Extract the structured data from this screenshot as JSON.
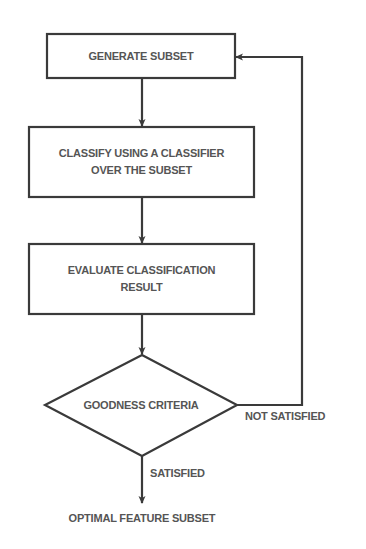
{
  "diagram": {
    "type": "flowchart",
    "colors": {
      "line": "#3a3a3a",
      "text": "#555555",
      "background": "#ffffff"
    },
    "nodes": [
      {
        "id": "generate",
        "shape": "rectangle",
        "label": "GENERATE SUBSET"
      },
      {
        "id": "classify",
        "shape": "rectangle",
        "label_line1": "CLASSIFY USING A CLASSIFIER",
        "label_line2": "OVER THE SUBSET"
      },
      {
        "id": "evaluate",
        "shape": "rectangle",
        "label_line1": "EVALUATE CLASSIFICATION",
        "label_line2": "RESULT"
      },
      {
        "id": "criteria",
        "shape": "diamond",
        "label": "GOODNESS CRITERIA"
      },
      {
        "id": "output",
        "shape": "terminal-text",
        "label": "OPTIMAL FEATURE SUBSET"
      }
    ],
    "edges": [
      {
        "from": "generate",
        "to": "classify",
        "label": ""
      },
      {
        "from": "classify",
        "to": "evaluate",
        "label": ""
      },
      {
        "from": "evaluate",
        "to": "criteria",
        "label": ""
      },
      {
        "from": "criteria",
        "to": "generate",
        "label": "NOT SATISFIED"
      },
      {
        "from": "criteria",
        "to": "output",
        "label": "SATISFIED"
      }
    ]
  }
}
